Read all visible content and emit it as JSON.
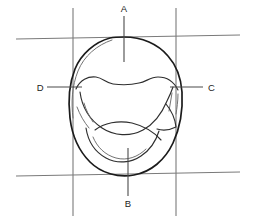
{
  "diagram": {
    "type": "hand-drawn anatomical line drawing",
    "canvas": {
      "width": 255,
      "height": 223,
      "background": "#ffffff"
    },
    "colors": {
      "outline": "#1b1b1b",
      "inner_detail": "#2e2e2e",
      "faint_detail": "#6b6b6b",
      "grid": "#7a7a7a",
      "leader": "#4a4a4a",
      "label_text": "#1b1b1b"
    },
    "labels": [
      {
        "id": "A",
        "text": "A",
        "position": "top",
        "x": 122,
        "y": 10,
        "leader_from": [
          124,
          16
        ],
        "leader_to": [
          124,
          62
        ]
      },
      {
        "id": "B",
        "text": "B",
        "position": "bottom",
        "x": 126,
        "y": 203,
        "leader_from": [
          128,
          196
        ],
        "leader_to": [
          128,
          148
        ]
      },
      {
        "id": "C",
        "text": "C",
        "position": "right",
        "x": 209,
        "y": 91,
        "leader_from": [
          203,
          87
        ],
        "leader_to": [
          170,
          87
        ]
      },
      {
        "id": "D",
        "text": "D",
        "position": "left",
        "x": 39,
        "y": 91,
        "leader_from": [
          47,
          87
        ],
        "leader_to": [
          82,
          87
        ]
      }
    ],
    "grid": {
      "description": "Two horizontal and two vertical reference lines forming a tic-tac-toe frame around the shape",
      "horizontal_lines": [
        {
          "name": "upper-horizontal",
          "x1": 16,
          "y1": 39,
          "x2": 240,
          "y2": 35
        },
        {
          "name": "lower-horizontal",
          "x1": 16,
          "y1": 176,
          "x2": 240,
          "y2": 172
        }
      ],
      "vertical_lines": [
        {
          "name": "left-vertical",
          "x1": 73,
          "y1": 8,
          "x2": 73,
          "y2": 216
        },
        {
          "name": "right-vertical",
          "x1": 176,
          "y1": 8,
          "x2": 176,
          "y2": 216
        }
      ]
    },
    "shape": {
      "name": "occlusal-outline",
      "description": "Rounded egg-shaped outer contour, wider at top, tapering to a rounded base",
      "inner_features": [
        {
          "name": "upper-ridge",
          "description": "Wavy transverse ridge across the upper third"
        },
        {
          "name": "central-fossa",
          "description": "Large crescent-shaped central depression"
        },
        {
          "name": "lower-ridge",
          "description": "Curved ridge across the lower third"
        },
        {
          "name": "right-groove",
          "description": "Short vertical groove near right margin"
        },
        {
          "name": "left-groove",
          "description": "Short oblique groove near left margin"
        }
      ]
    }
  }
}
